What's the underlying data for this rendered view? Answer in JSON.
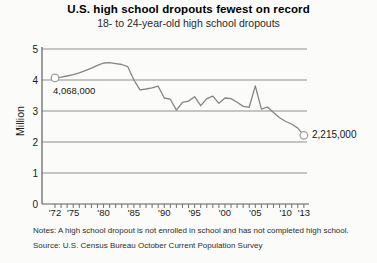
{
  "page": {
    "background": "#fbfbf9"
  },
  "chart_data": {
    "type": "line",
    "title": "U.S. high school dropouts fewest on record",
    "subtitle": "18- to 24-year-old high school dropouts",
    "ylabel": "Million",
    "series_name": "18- to 24-year-old high school dropouts (millions)",
    "x": [
      1972,
      1973,
      1974,
      1975,
      1976,
      1977,
      1978,
      1979,
      1980,
      1981,
      1982,
      1983,
      1984,
      1985,
      1986,
      1987,
      1988,
      1989,
      1990,
      1991,
      1992,
      1993,
      1994,
      1995,
      1996,
      1997,
      1998,
      1999,
      2000,
      2001,
      2002,
      2003,
      2004,
      2005,
      2006,
      2007,
      2008,
      2009,
      2010,
      2011,
      2012,
      2013
    ],
    "values_million": [
      4.068,
      4.09,
      4.13,
      4.17,
      4.23,
      4.3,
      4.38,
      4.47,
      4.55,
      4.56,
      4.53,
      4.5,
      4.43,
      4.0,
      3.68,
      3.71,
      3.75,
      3.8,
      3.42,
      3.38,
      3.03,
      3.28,
      3.32,
      3.46,
      3.17,
      3.4,
      3.48,
      3.25,
      3.42,
      3.4,
      3.28,
      3.15,
      3.12,
      3.81,
      3.06,
      3.13,
      2.95,
      2.78,
      2.66,
      2.58,
      2.45,
      2.215
    ],
    "ylim": [
      0,
      5
    ],
    "y_ticks": [
      "0",
      "1",
      "2",
      "3",
      "4",
      "5"
    ],
    "x_tick_labels": [
      {
        "year": 1972,
        "label": "'72"
      },
      {
        "year": 1975,
        "label": "'75"
      },
      {
        "year": 1980,
        "label": "'80"
      },
      {
        "year": 1985,
        "label": "'85"
      },
      {
        "year": 1990,
        "label": "'90"
      },
      {
        "year": 1995,
        "label": "'95"
      },
      {
        "year": 2000,
        "label": "'00"
      },
      {
        "year": 2005,
        "label": "'05"
      },
      {
        "year": 2010,
        "label": "'10"
      },
      {
        "year": 2013,
        "label": "'13"
      }
    ],
    "grid": "horizontal",
    "legend": "none",
    "line_color": "#858585",
    "marker_stroke_color": "#a0a0a0",
    "grid_color": "#8f8f8f",
    "axis_color": "#5f5f5f",
    "annotations": {
      "first_point_label": "4,068,000",
      "last_point_label": "2,215,000"
    },
    "notes": "Notes: A high school dropout is not enrolled in school and has not completed high school.",
    "source": "Source: U.S. Census Bureau October Current Population Survey"
  }
}
